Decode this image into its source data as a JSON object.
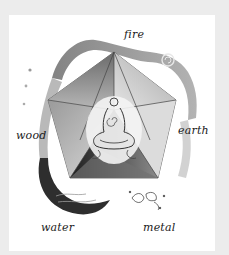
{
  "illustration": {
    "subject": "five elements around a pentagonal polyhedron with a meditating figure",
    "labels": {
      "fire": "fire",
      "earth": "earth",
      "metal": "metal",
      "water": "water",
      "wood": "wood"
    },
    "colors": {
      "frame": "#ececec",
      "card": "#ffffff",
      "ink": "#1a1a1a",
      "shade_dark": "#3a3a3a",
      "shade_mid": "#7a7a7a",
      "shade_light": "#c8c8c8"
    }
  }
}
